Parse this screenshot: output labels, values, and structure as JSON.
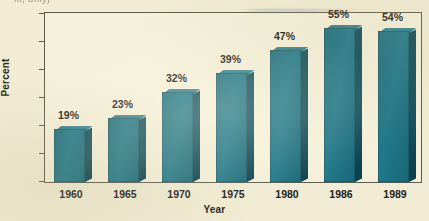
{
  "figure": {
    "caption_remnant": "ilt, Only)",
    "background_color": "#f1ecd3",
    "plot_background_color": "#f5f0da",
    "frame_color": "#5d5a49"
  },
  "chart_data": {
    "type": "bar",
    "title": "",
    "subtitle": "",
    "xlabel": "Year",
    "ylabel": "Percent",
    "categories": [
      "1960",
      "1965",
      "1970",
      "1975",
      "1980",
      "1986",
      "1989"
    ],
    "values": [
      19,
      23,
      32,
      39,
      47,
      55,
      54
    ],
    "data_labels": [
      "19%",
      "23%",
      "32%",
      "39%",
      "47%",
      "55%",
      "54%"
    ],
    "ylim": [
      0,
      60
    ],
    "yticks": [
      0,
      10,
      20,
      30,
      40,
      50,
      60
    ],
    "ytick_labels": [
      "0",
      "10",
      "20",
      "30",
      "40",
      "50",
      "60"
    ],
    "grid": false,
    "legend": null,
    "legend_position": "none",
    "series": [
      {
        "name": "Percent",
        "values": [
          19,
          23,
          32,
          39,
          47,
          55,
          54
        ],
        "color": "#1f7384",
        "side_color": "#11505e",
        "top_color": "#2d8a9c"
      }
    ],
    "style": "3d-bar",
    "annotations": []
  }
}
